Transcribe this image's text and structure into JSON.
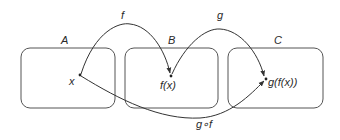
{
  "diagram": {
    "title": "",
    "sets": [
      {
        "id": "A",
        "label": "A"
      },
      {
        "id": "B",
        "label": "B"
      },
      {
        "id": "C",
        "label": "C"
      }
    ],
    "points": [
      {
        "id": "x",
        "label": "x",
        "set": "A"
      },
      {
        "id": "fx",
        "label": "f(x)",
        "set": "B"
      },
      {
        "id": "gfx",
        "label": "g(f(x))",
        "set": "C"
      }
    ],
    "arrows": [
      {
        "id": "f",
        "label": "f",
        "from": "x",
        "to": "fx"
      },
      {
        "id": "g",
        "label": "g",
        "from": "fx",
        "to": "gfx"
      },
      {
        "id": "gof",
        "label": "g∘f",
        "from": "x",
        "to": "gfx"
      }
    ],
    "colors": {
      "stroke": "#333333",
      "box": "#555555",
      "text": "#2a2a2a",
      "background": "#ffffff"
    }
  }
}
